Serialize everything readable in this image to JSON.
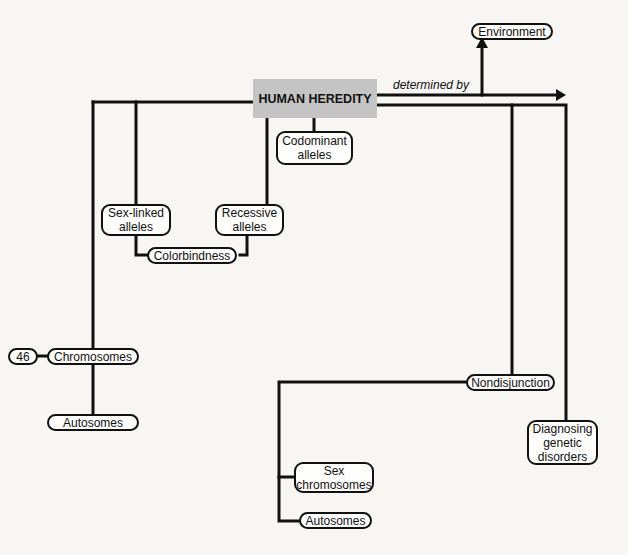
{
  "diagram": {
    "title": "HUMAN HEREDITY",
    "link_label": "determined by",
    "nodes": {
      "environment": "Environment",
      "codominant": "Codominant\nalleles",
      "sex_linked": "Sex-linked\nalleles",
      "recessive": "Recessive\nalleles",
      "colorblindness": "Colorbindness",
      "count_46": "46",
      "chromosomes": "Chromosomes",
      "autosomes_left": "Autosomes",
      "nondisjunction": "Nondisjunction",
      "diagnosing": "Diagnosing\ngenetic\ndisorders",
      "sex_chromosomes": "Sex\nchromosomes",
      "autosomes_right": "Autosomes"
    },
    "colors": {
      "line": "#111111",
      "main_fill": "#c4c4c4",
      "background": "#f7f6f3"
    }
  }
}
